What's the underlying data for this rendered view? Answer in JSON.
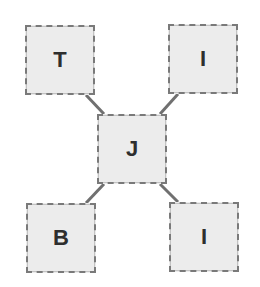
{
  "diagram": {
    "type": "star",
    "colors": {
      "node_fill": "#ececec",
      "node_border": "#7a7a7a",
      "edge": "#707070",
      "text": "#2e2e2e"
    },
    "nodes": [
      {
        "id": "top-left",
        "label": "T",
        "x": 25,
        "y": 25,
        "w": 70,
        "h": 70
      },
      {
        "id": "top-right",
        "label": "I",
        "x": 168,
        "y": 24,
        "w": 70,
        "h": 70
      },
      {
        "id": "center",
        "label": "J",
        "x": 97,
        "y": 114,
        "w": 70,
        "h": 70
      },
      {
        "id": "bottom-left",
        "label": "B",
        "x": 26,
        "y": 203,
        "w": 70,
        "h": 70
      },
      {
        "id": "bottom-right",
        "label": "I",
        "x": 169,
        "y": 202,
        "w": 70,
        "h": 70
      }
    ],
    "edges": [
      {
        "from": "center",
        "to": "top-left"
      },
      {
        "from": "center",
        "to": "top-right"
      },
      {
        "from": "center",
        "to": "bottom-left"
      },
      {
        "from": "center",
        "to": "bottom-right"
      }
    ]
  }
}
